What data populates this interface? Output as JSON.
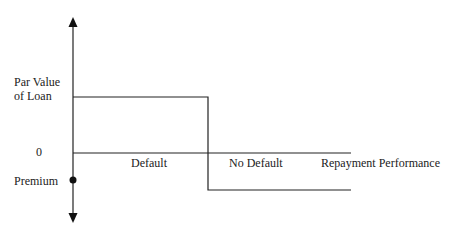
{
  "diagram": {
    "type": "payoff-step-diagram",
    "y_axis_labels": {
      "par_value_line1": "Par Value",
      "par_value_line2": "of Loan",
      "zero": "0",
      "premium": "Premium"
    },
    "x_axis_labels": {
      "default": "Default",
      "no_default": "No Default",
      "axis_title": "Repayment Performance"
    },
    "line_color": "#222222"
  }
}
